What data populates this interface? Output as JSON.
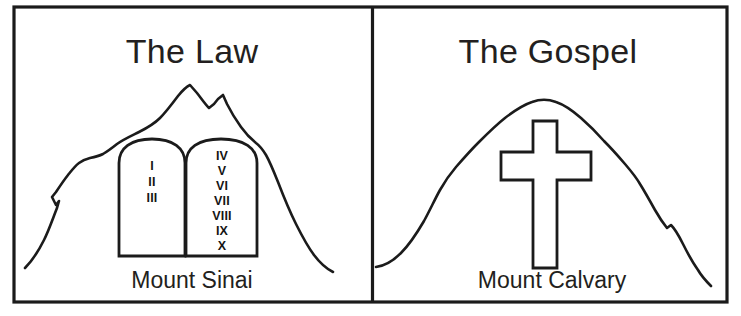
{
  "figure": {
    "background_color": "#ffffff",
    "ink_color": "#1b1b1b"
  },
  "panels": [
    {
      "id": "law",
      "heading": "The Law",
      "caption": "Mount Sinai",
      "mountain_name": "Mount Sinai",
      "tablets": {
        "left": {
          "numerals": [
            "I",
            "II",
            "III"
          ]
        },
        "right": {
          "numerals": [
            "IV",
            "V",
            "VI",
            "VII",
            "VIII",
            "IX",
            "X"
          ]
        }
      }
    },
    {
      "id": "gospel",
      "heading": "The Gospel",
      "caption": "Mount Calvary",
      "mountain_name": "Mount Calvary",
      "symbol": "latin-cross"
    }
  ],
  "icons": {
    "mountain": "mountain-outline-icon",
    "tablets": "stone-tablets-icon",
    "cross": "latin-cross-icon"
  }
}
